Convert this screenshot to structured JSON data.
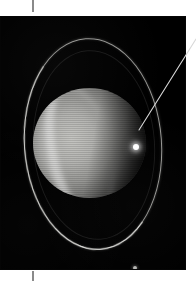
{
  "figure": {
    "caption": "",
    "plate_background": "#000000",
    "page_background": "#ffffff"
  },
  "crop_marks": {
    "top_label": "top-registration-tick",
    "bottom_label": "bottom-registration-tick",
    "color": "#8a8a8a"
  },
  "astronomy": {
    "object_name": "",
    "planet": {
      "label": "planet-disk",
      "bands_visible": "yes",
      "limb_shading": "terminator-right"
    },
    "rings": [
      {
        "label": "outer-ring-ellipse",
        "brightness": "bright"
      },
      {
        "label": "inner-ring-ellipse",
        "brightness": "faint"
      }
    ],
    "satellites": [
      {
        "label": "bright-satellite",
        "x": 136,
        "y": 131,
        "brightness": "bright",
        "annotated": "yes"
      },
      {
        "label": "faint-satellite",
        "x": 135,
        "y": 252,
        "brightness": "faint",
        "annotated": "no"
      }
    ],
    "annotation": {
      "leader_line_label": "satellite-leader-line",
      "leader_color": "#d8d8d8",
      "from_x": 138,
      "from_y": 130,
      "to_x": 196,
      "to_y": 40,
      "callout_text": ""
    }
  }
}
